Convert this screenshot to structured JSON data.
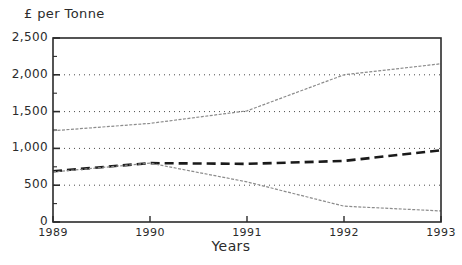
{
  "chart_data": {
    "type": "line",
    "title": "",
    "ylabel": "£ per Tonne",
    "xlabel": "Years",
    "x": [
      1989,
      1990,
      1991,
      1992,
      1993
    ],
    "xtick_labels": [
      "1989",
      "1990",
      "1991",
      "1992",
      "1993"
    ],
    "ytick_labels": [
      "0",
      "500",
      "1,000",
      "1,500",
      "2,000",
      "2,500"
    ],
    "ytick_values": [
      0,
      500,
      1000,
      1500,
      2000,
      2500
    ],
    "ylim": [
      0,
      2500
    ],
    "xlim": [
      1989,
      1993
    ],
    "grid": "horizontal-dotted",
    "legend": "none",
    "series": [
      {
        "name": "upper-series",
        "style": "thin-solid-grey",
        "color": "#8c8c8c",
        "values": [
          1240,
          1340,
          1510,
          2000,
          2150
        ]
      },
      {
        "name": "middle-series",
        "style": "thick-dashed-black",
        "color": "#1a1a1a",
        "values": [
          690,
          800,
          790,
          830,
          975
        ]
      },
      {
        "name": "lower-series",
        "style": "thin-solid-grey",
        "color": "#8c8c8c",
        "values": [
          680,
          800,
          545,
          215,
          150
        ]
      }
    ]
  },
  "colors": {
    "frame": "#2b2b2b",
    "grid": "#4a4a4a",
    "background": "#ffffff",
    "series_grey": "#8c8c8c",
    "series_black": "#1a1a1a"
  }
}
